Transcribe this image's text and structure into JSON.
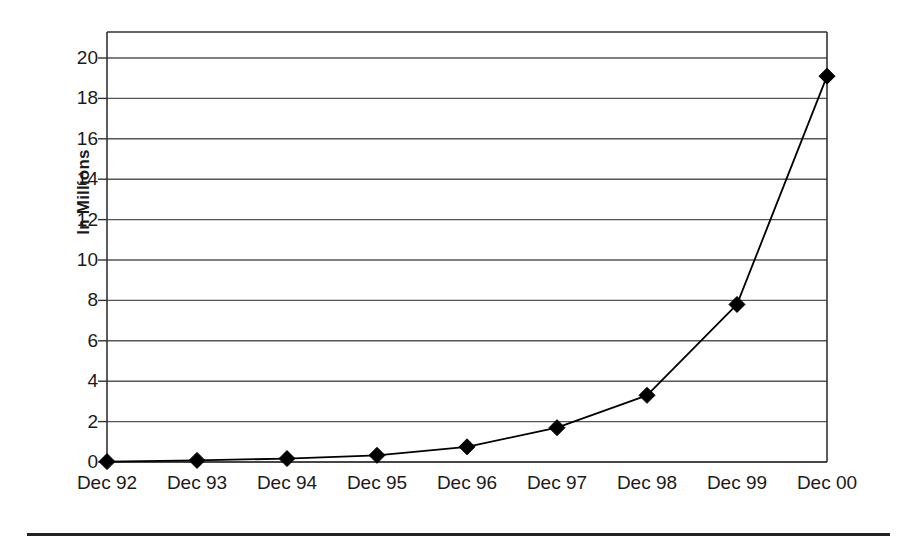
{
  "chart_data": {
    "type": "line",
    "title": "",
    "xlabel": "",
    "ylabel": "In Millions",
    "categories": [
      "Dec 92",
      "Dec 93",
      "Dec 94",
      "Dec 95",
      "Dec 96",
      "Dec 97",
      "Dec 98",
      "Dec 99",
      "Dec 00"
    ],
    "values": [
      0.02,
      0.08,
      0.17,
      0.33,
      0.75,
      1.7,
      3.3,
      7.8,
      19.1
    ],
    "series": [
      {
        "name": "In Millions",
        "values": [
          0.02,
          0.08,
          0.17,
          0.33,
          0.75,
          1.7,
          3.3,
          7.8,
          19.1
        ],
        "color": "#000000",
        "marker": "diamond"
      }
    ],
    "ylim": [
      0,
      21
    ],
    "y_ticks": [
      0,
      2,
      4,
      6,
      8,
      10,
      12,
      14,
      16,
      18,
      20
    ],
    "y_tick_labels": [
      "0",
      "2",
      "4",
      "6",
      "8",
      "10",
      "12",
      "14",
      "16",
      "18",
      "20"
    ],
    "grid": true,
    "grid_axis": "y",
    "legend": false,
    "legend_position": "none",
    "line_color": "#000000",
    "marker_color": "#000000",
    "grid_color": "#555555",
    "axis_color": "#333333",
    "background": "#ffffff"
  },
  "figure": {
    "bottom_rule_color": "#222222"
  }
}
